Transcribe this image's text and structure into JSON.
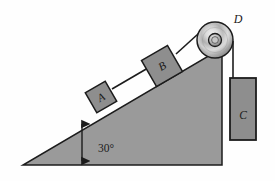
{
  "figure": {
    "kind": "inclined-plane-pulley-diagram",
    "background_color": "#fefefe"
  },
  "incline": {
    "name": "inclined-ramp",
    "angle_label": "30°",
    "angle_value": 30,
    "fill_color": "#9a9a9a",
    "stroke_color": "#1c1c1c",
    "apex_left": [
      23,
      165
    ],
    "corner_bottom_right": [
      222,
      165
    ],
    "corner_top_right": [
      222,
      48
    ]
  },
  "blocks": [
    {
      "id": "block-a",
      "label": "A",
      "fill_color": "#8e8e8e",
      "stroke_color": "#1c1c1c",
      "label_x": 101,
      "label_y": 101,
      "size": 23,
      "center_x": 101,
      "center_y": 97
    },
    {
      "id": "block-b",
      "label": "B",
      "fill_color": "#8e8e8e",
      "stroke_color": "#1c1c1c",
      "label_x": 162,
      "label_y": 70,
      "size": 30,
      "center_x": 162,
      "center_y": 66
    },
    {
      "id": "block-c",
      "label": "C",
      "fill_color": "#8e8e8e",
      "stroke_color": "#1c1c1c",
      "label_x": 243,
      "label_y": 115,
      "x": 230,
      "y": 78,
      "width": 26,
      "height": 62
    }
  ],
  "pulley": {
    "id": "pulley-d",
    "label": "D",
    "label_x": 238,
    "label_y": 19,
    "center_x": 215,
    "center_y": 40,
    "radius": 18,
    "hub_radius": 6.5,
    "hub_inner_radius": 3.4,
    "rim_color": "#6d6d6d",
    "highlight_color": "#efefef",
    "stroke_color": "#1c1c1c"
  },
  "cords": [
    {
      "id": "cord-a-to-b",
      "from": [
        112,
        89
      ],
      "to": [
        148,
        68
      ],
      "color": "#1c1c1c"
    },
    {
      "id": "cord-b-to-pulley",
      "from": [
        176,
        54
      ],
      "to": [
        209,
        24
      ],
      "color": "#1c1c1c"
    },
    {
      "id": "cord-pulley-to-c",
      "from": [
        233,
        41
      ],
      "to": [
        233,
        78
      ],
      "color": "#1c1c1c"
    }
  ],
  "annotations": {
    "angle_arrow": {
      "id": "angle-double-arrow",
      "label": "30°",
      "x": 82,
      "y_top": 122,
      "y_bottom": 163,
      "text_x": 98,
      "text_y": 148,
      "color": "#1c1c1c"
    }
  }
}
